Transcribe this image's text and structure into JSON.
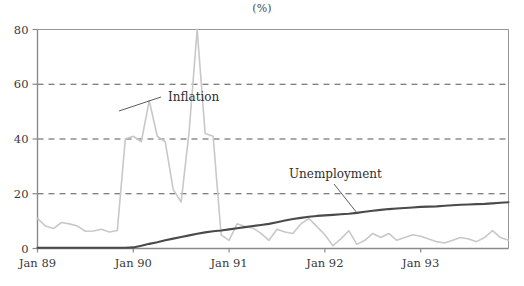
{
  "chart_data": {
    "type": "line",
    "title": "(%)",
    "xlabel": "",
    "ylabel": "(%)",
    "ylim": [
      0,
      80
    ],
    "yticks": [
      0,
      20,
      40,
      60,
      80
    ],
    "ytick_labels": [
      "0",
      "20",
      "40",
      "60",
      "80"
    ],
    "grid": "horizontal-dashed",
    "gridlines_at": [
      20,
      40,
      60
    ],
    "legend": "inline-annotations",
    "xtick_labels": [
      "Jan 89",
      "Jan 90",
      "Jan 91",
      "Jan 92",
      "Jan 93"
    ],
    "xtick_positions_months": [
      0,
      12,
      24,
      36,
      48
    ],
    "x_unit": "month",
    "x_range_months": [
      0,
      59
    ],
    "annotations": [
      {
        "text": "Inflation",
        "series": "Inflation",
        "x_month": 15.5,
        "y_value": 52
      },
      {
        "text": "Unemployment",
        "series": "Unemployment",
        "x_month": 34.5,
        "y_value": 14
      }
    ],
    "colors": {
      "inflation": "#c8c8c8",
      "unemployment": "#4a4a4a",
      "grid": "#555555",
      "axis": "#8a8a8a",
      "text": "#3a3a3a"
    },
    "series": [
      {
        "name": "Inflation",
        "color": "#c8c8c8",
        "values": [
          11.0,
          8.2,
          7.3,
          9.5,
          9.0,
          8.2,
          6.3,
          6.4,
          7.0,
          6.0,
          6.6,
          40.0,
          41.0,
          39.0,
          54.0,
          41.0,
          39.0,
          21.5,
          17.0,
          43.0,
          80.0,
          42.0,
          41.0,
          5.0,
          3.0,
          9.0,
          8.0,
          7.5,
          5.5,
          3.0,
          7.0,
          6.0,
          5.5,
          9.0,
          11.0,
          8.0,
          5.0,
          1.0,
          3.5,
          6.5,
          1.5,
          3.0,
          5.5,
          4.0,
          5.5,
          3.0,
          4.0,
          5.0,
          4.5,
          3.5,
          2.5,
          2.0,
          3.0,
          4.0,
          3.5,
          2.5,
          4.0,
          6.5,
          4.0,
          3.0
        ]
      },
      {
        "name": "Unemployment",
        "color": "#4a4a4a",
        "values": [
          0.3,
          0.3,
          0.3,
          0.3,
          0.3,
          0.3,
          0.3,
          0.3,
          0.3,
          0.3,
          0.3,
          0.3,
          0.4,
          1.0,
          1.7,
          2.3,
          3.0,
          3.6,
          4.2,
          4.8,
          5.4,
          5.9,
          6.3,
          6.6,
          7.0,
          7.4,
          7.8,
          8.2,
          8.6,
          9.0,
          9.6,
          10.2,
          10.8,
          11.2,
          11.6,
          11.9,
          12.1,
          12.3,
          12.5,
          12.7,
          13.0,
          13.4,
          13.8,
          14.1,
          14.4,
          14.6,
          14.8,
          15.0,
          15.2,
          15.3,
          15.4,
          15.6,
          15.8,
          16.0,
          16.1,
          16.2,
          16.3,
          16.5,
          16.7,
          16.9
        ]
      }
    ]
  }
}
